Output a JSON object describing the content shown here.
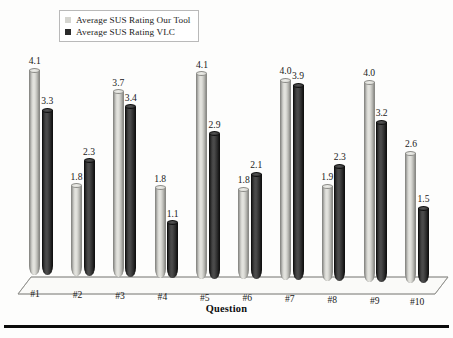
{
  "legend": {
    "position": "top-left",
    "items": [
      {
        "label": "Average SUS Rating Our Tool",
        "color": "#d8d8d3",
        "marker": "square-light"
      },
      {
        "label": "Average SUS Rating VLC",
        "color": "#262626",
        "marker": "square-dark"
      }
    ]
  },
  "axis": {
    "x_title": "Question"
  },
  "chart_data": {
    "type": "bar",
    "title": "",
    "subtitle": "",
    "xlabel": "Question",
    "ylabel": "",
    "ylim": [
      0,
      4.6
    ],
    "grid": false,
    "legend_position": "top-left",
    "categories": [
      "#1",
      "#2",
      "#3",
      "#4",
      "#5",
      "#6",
      "#7",
      "#8",
      "#9",
      "#10"
    ],
    "series": [
      {
        "name": "Average SUS Rating Our Tool",
        "color": "#d8d8d3",
        "values": [
          4.1,
          1.8,
          3.7,
          1.8,
          4.1,
          1.8,
          4.0,
          1.9,
          4.0,
          2.6
        ],
        "labels": [
          "4.1",
          "1.8",
          "3.7",
          "1.8",
          "4.1",
          "1.8",
          "4.0",
          "1.9",
          "4.0",
          "2.6"
        ]
      },
      {
        "name": "Average SUS Rating VLC",
        "color": "#262626",
        "values": [
          3.3,
          2.3,
          3.4,
          1.1,
          2.9,
          2.1,
          3.9,
          2.3,
          3.2,
          1.5
        ],
        "labels": [
          "3.3",
          "2.3",
          "3.4",
          "1.1",
          "2.9",
          "2.1",
          "3.9",
          "2.3",
          "3.2",
          "1.5"
        ]
      }
    ]
  }
}
